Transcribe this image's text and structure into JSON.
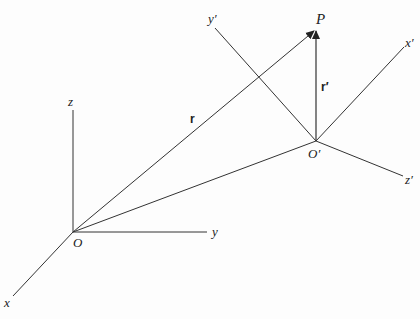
{
  "diagram": {
    "title": "",
    "frames": [
      {
        "name": "unprimed",
        "origin_label": "O",
        "axes": [
          {
            "label": "x"
          },
          {
            "label": "y"
          },
          {
            "label": "z"
          }
        ]
      },
      {
        "name": "primed",
        "origin_label": "O′",
        "axes": [
          {
            "label": "x′"
          },
          {
            "label": "y′"
          },
          {
            "label": "z′"
          }
        ]
      }
    ],
    "point_label": "P",
    "vectors": [
      {
        "label": "r",
        "from": "O",
        "to": "P"
      },
      {
        "label": "r′",
        "from": "O′",
        "to": "P"
      }
    ],
    "connector": {
      "from": "O",
      "to": "O′"
    },
    "colors": {
      "line": "#333333",
      "text": "#222222",
      "background": "#fdfdfd"
    }
  }
}
